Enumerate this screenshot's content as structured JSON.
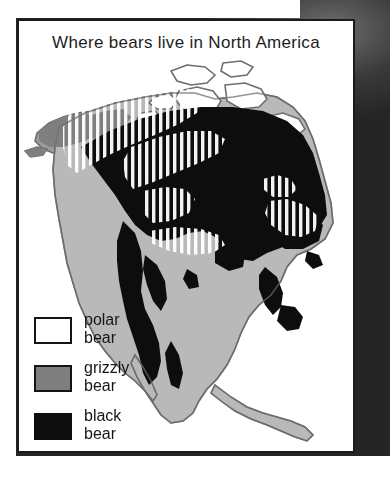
{
  "figure": {
    "title": "Where bears live in North America",
    "border_color": "#1b1b1b",
    "background": "#ffffff"
  },
  "legend": {
    "items": [
      {
        "name": "polar-bear",
        "line1": "polar",
        "line2": "bear",
        "swatch": "white",
        "color": "#ffffff"
      },
      {
        "name": "grizzly-bear",
        "line1": "grizzly",
        "line2": "bear",
        "swatch": "gray",
        "color": "#7f7f7f"
      },
      {
        "name": "black-bear",
        "line1": "black",
        "line2": "bear",
        "swatch": "black",
        "color": "#0d0d0d"
      }
    ]
  },
  "map": {
    "region": "North America",
    "land_base_color": "#b9b9b9",
    "coastline_color": "#6e6e6e",
    "black_bear_color": "#111111",
    "grizzly_color": "#7f7f7f",
    "polar_stripe_color": "#ffffff",
    "ocean_color": "#ffffff"
  },
  "page": {
    "photo_background": "grayscale photograph"
  }
}
